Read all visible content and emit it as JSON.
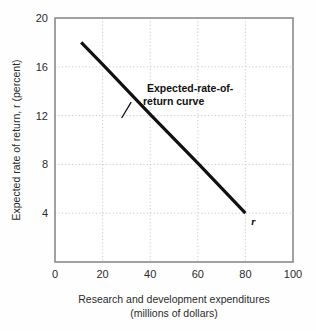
{
  "chart_data": {
    "type": "line",
    "title": "",
    "subtitle": "",
    "xlabel_line1": "Research and development expenditures",
    "xlabel_line2": "(millions of dollars)",
    "ylabel": "Expected rate of return, r (percent)",
    "xlim": [
      0,
      100
    ],
    "ylim": [
      0,
      20
    ],
    "grid": true,
    "grid_style": "dotted",
    "legend_position": "none",
    "xticks": [
      0,
      20,
      40,
      60,
      80,
      100
    ],
    "xtick_labels": [
      "0",
      "20",
      "40",
      "60",
      "80",
      "100"
    ],
    "yticks": [
      4,
      8,
      12,
      16,
      20
    ],
    "ytick_labels": [
      "4",
      "8",
      "12",
      "16",
      "20"
    ],
    "x_gridlines": [
      20,
      40,
      60,
      80
    ],
    "y_gridlines": [
      4,
      8,
      12,
      16
    ],
    "series": [
      {
        "name": "Expected-rate-of-return curve",
        "symbol": "r",
        "color": "#111111",
        "linewidth": 3.2,
        "x": [
          11,
          80
        ],
        "y": [
          18,
          4
        ],
        "points": [
          {
            "x": 11,
            "y": 18
          },
          {
            "x": 20,
            "y": 16.2
          },
          {
            "x": 40,
            "y": 12.1
          },
          {
            "x": 60,
            "y": 8.1
          },
          {
            "x": 80,
            "y": 4
          }
        ]
      }
    ],
    "annotations": [
      {
        "name": "curve-label",
        "line1": "Expected-rate-of-",
        "line2": "return curve",
        "leader_from": [
          32,
          13.1
        ],
        "leader_to": [
          28,
          11.8
        ]
      },
      {
        "name": "curve-symbol",
        "text": "r",
        "at": [
          82.5,
          3.0
        ]
      }
    ],
    "colors": {
      "curve": "#111111",
      "grid": "#c9c9c9",
      "frame": "#8a8a8a",
      "text": "#2b2b2b",
      "background": "#fefefe"
    }
  }
}
